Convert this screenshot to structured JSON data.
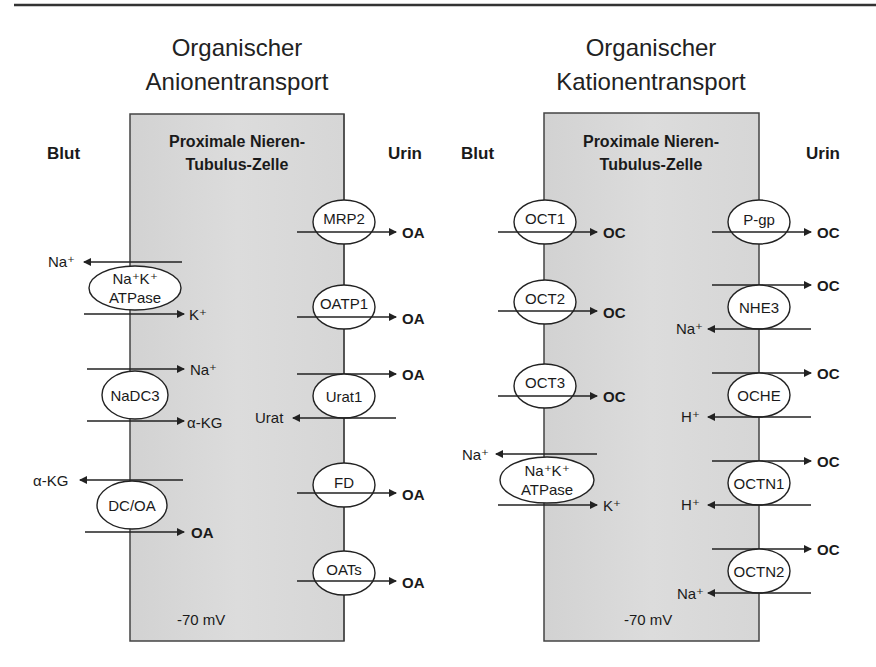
{
  "top_rule": true,
  "panels": [
    {
      "id": "anion",
      "title_line1": "Organischer",
      "title_line2": "Anionentransport",
      "blood_label": "Blut",
      "urine_label": "Urin",
      "cell_title_line1": "Proximale Nieren-",
      "cell_title_line2": "Tubulus-Zelle",
      "membrane_potential": "-70 mV",
      "basolateral_transporters": [
        {
          "name_line1": "Na⁺K⁺",
          "name_line2": "ATPase",
          "flows": [
            {
              "substrate": "Na⁺",
              "direction": "out"
            },
            {
              "substrate": "K⁺",
              "direction": "in"
            }
          ]
        },
        {
          "name_line1": "NaDC3",
          "flows": [
            {
              "substrate": "Na⁺",
              "direction": "in"
            },
            {
              "substrate": "α-KG",
              "direction": "in"
            }
          ]
        },
        {
          "name_line1": "DC/OA",
          "flows": [
            {
              "substrate": "α-KG",
              "direction": "out"
            },
            {
              "substrate": "OA",
              "direction": "in"
            }
          ]
        }
      ],
      "apical_transporters": [
        {
          "name_line1": "MRP2",
          "flows": [
            {
              "substrate": "OA",
              "direction": "out"
            }
          ]
        },
        {
          "name_line1": "OATP1",
          "flows": [
            {
              "substrate": "OA",
              "direction": "out"
            }
          ]
        },
        {
          "name_line1": "Urat1",
          "flows": [
            {
              "substrate": "OA",
              "direction": "out"
            },
            {
              "substrate": "Urat",
              "direction": "in"
            }
          ]
        },
        {
          "name_line1": "FD",
          "flows": [
            {
              "substrate": "OA",
              "direction": "out"
            }
          ]
        },
        {
          "name_line1": "OATs",
          "flows": [
            {
              "substrate": "OA",
              "direction": "out"
            }
          ]
        }
      ]
    },
    {
      "id": "cation",
      "title_line1": "Organischer",
      "title_line2": "Kationentransport",
      "blood_label": "Blut",
      "urine_label": "Urin",
      "cell_title_line1": "Proximale Nieren-",
      "cell_title_line2": "Tubulus-Zelle",
      "membrane_potential": "-70 mV",
      "basolateral_transporters": [
        {
          "name_line1": "OCT1",
          "flows": [
            {
              "substrate": "OC",
              "direction": "in"
            }
          ]
        },
        {
          "name_line1": "OCT2",
          "flows": [
            {
              "substrate": "OC",
              "direction": "in"
            }
          ]
        },
        {
          "name_line1": "OCT3",
          "flows": [
            {
              "substrate": "OC",
              "direction": "in"
            }
          ]
        },
        {
          "name_line1": "Na⁺K⁺",
          "name_line2": "ATPase",
          "flows": [
            {
              "substrate": "Na⁺",
              "direction": "out"
            },
            {
              "substrate": "K⁺",
              "direction": "in"
            }
          ]
        }
      ],
      "apical_transporters": [
        {
          "name_line1": "P-gp",
          "flows": [
            {
              "substrate": "OC",
              "direction": "out"
            }
          ]
        },
        {
          "name_line1": "NHE3",
          "flows": [
            {
              "substrate": "OC",
              "direction": "out"
            },
            {
              "substrate": "Na⁺",
              "direction": "in"
            }
          ]
        },
        {
          "name_line1": "OCHE",
          "flows": [
            {
              "substrate": "OC",
              "direction": "out"
            },
            {
              "substrate": "H⁺",
              "direction": "in"
            }
          ]
        },
        {
          "name_line1": "OCTN1",
          "flows": [
            {
              "substrate": "OC",
              "direction": "out"
            },
            {
              "substrate": "H⁺",
              "direction": "in"
            }
          ]
        },
        {
          "name_line1": "OCTN2",
          "flows": [
            {
              "substrate": "OC",
              "direction": "out"
            },
            {
              "substrate": "Na⁺",
              "direction": "in"
            }
          ]
        }
      ]
    }
  ],
  "colors": {
    "cell_fill": "#d9d9d9",
    "line": "#2a2a2a",
    "background": "#ffffff"
  }
}
